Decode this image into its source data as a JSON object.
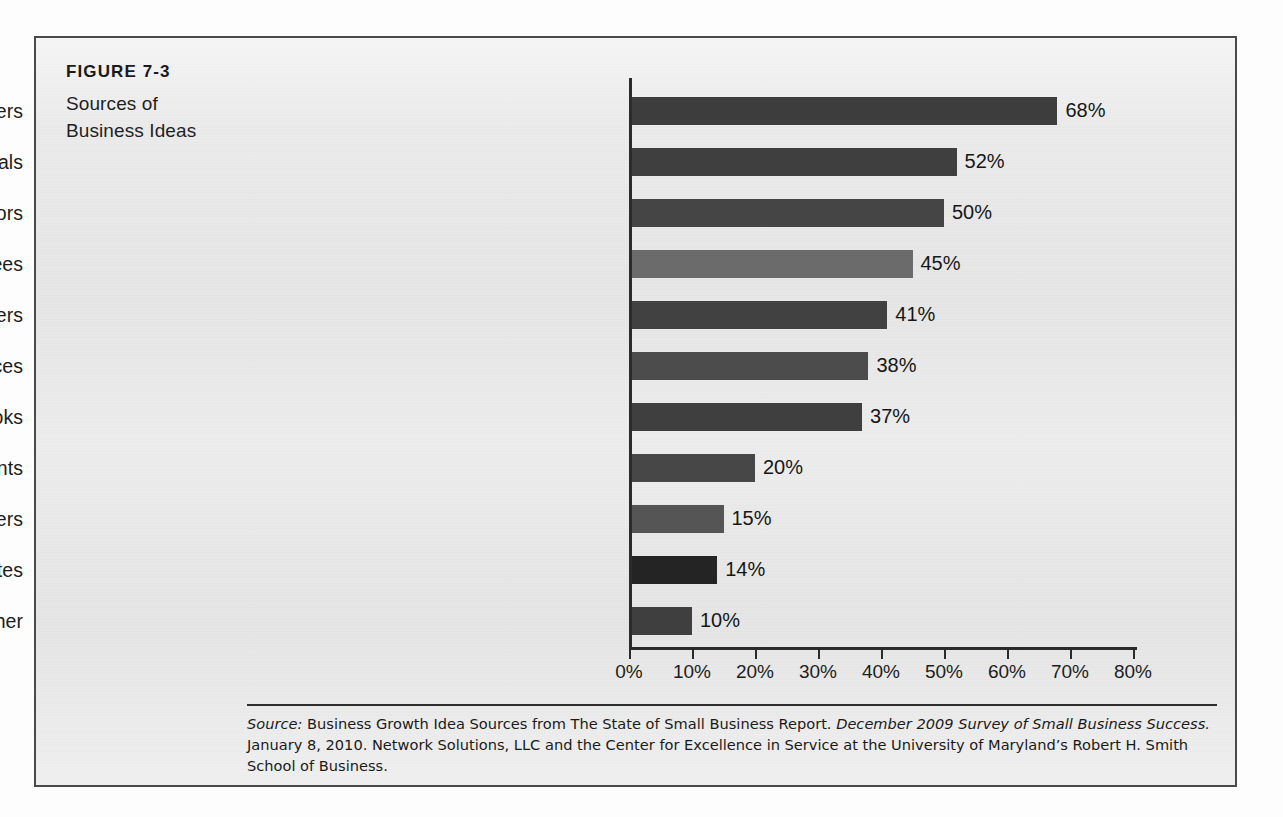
{
  "figure": {
    "number": "FIGURE 7-3",
    "title_line1": "Sources of",
    "title_line2": "Business Ideas"
  },
  "source_note": {
    "label": "Source:",
    "text_before_title": " Business Growth Idea Sources from The State of Small Business Report. ",
    "italic_title": "December 2009 Survey of Small Business Success.",
    "text_after_title": " January 8, 2010. Network Solutions, LLC and the Center for Excellence in Service at the University of Maryland’s Robert H. Smith School of Business."
  },
  "colors": {
    "bar_default": "#414141",
    "bar_light": "#6b6b6b",
    "bar_dark": "#242424",
    "axis": "#2b2b2b",
    "frame": "#4a4a4a",
    "background": "#e9e9e9",
    "text": "#1a1a1a"
  },
  "chart_data": {
    "type": "bar",
    "orientation": "horizontal",
    "title": "Sources of Business Ideas",
    "xlabel": "",
    "ylabel": "",
    "xlim": [
      0,
      80
    ],
    "grid": false,
    "legend": false,
    "value_suffix": "%",
    "xticks": [
      "0%",
      "10%",
      "20%",
      "30%",
      "40%",
      "50%",
      "60%",
      "70%",
      "80%"
    ],
    "xtick_values": [
      0,
      10,
      20,
      30,
      40,
      50,
      60,
      70,
      80
    ],
    "categories": [
      "Customers",
      "Newspapers and trade journals",
      "Competitors",
      "Employees",
      "Suppliers",
      "Conferences",
      "Books",
      "Consultants",
      "Blogs or online newsletters",
      "Social-networking sites",
      "Other"
    ],
    "values": [
      68,
      52,
      50,
      45,
      41,
      38,
      37,
      20,
      15,
      14,
      10
    ],
    "labels": [
      "68%",
      "52%",
      "50%",
      "45%",
      "41%",
      "38%",
      "37%",
      "20%",
      "15%",
      "14%",
      "10%"
    ],
    "bar_colors": [
      "#3d3d3d",
      "#3f3f3f",
      "#454545",
      "#6b6b6b",
      "#414141",
      "#4c4c4c",
      "#3f3f3f",
      "#474747",
      "#555555",
      "#242424",
      "#3f3f3f"
    ]
  }
}
